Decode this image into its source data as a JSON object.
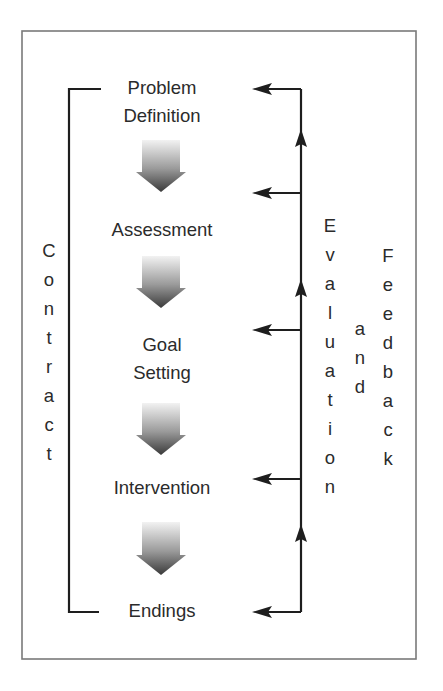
{
  "diagram": {
    "title": "",
    "colors": {
      "frame": "#7a7a7a",
      "lines": "#1e1e1e",
      "text": "#2b2b2b",
      "arrow_gradient_top": "#f2f2f2",
      "arrow_gradient_bottom": "#3a3a3a"
    },
    "steps": [
      {
        "lines": [
          "Problem",
          "Definition"
        ]
      },
      {
        "lines": [
          "Assessment"
        ]
      },
      {
        "lines": [
          "Goal",
          "Setting"
        ]
      },
      {
        "lines": [
          "Intervention"
        ]
      },
      {
        "lines": [
          "Endings"
        ]
      }
    ],
    "left_bracket_label": {
      "text": "Contract",
      "letters": [
        "C",
        "o",
        "n",
        "t",
        "r",
        "a",
        "c",
        "t"
      ]
    },
    "right_labels": {
      "evaluation": {
        "text": "Evaluation",
        "letters": [
          "E",
          "v",
          "a",
          "l",
          "u",
          "a",
          "t",
          "i",
          "o",
          "n"
        ]
      },
      "and": {
        "text": "and",
        "letters": [
          "a",
          "n",
          "d"
        ]
      },
      "feedback": {
        "text": "Feedback",
        "letters": [
          "F",
          "e",
          "e",
          "d",
          "b",
          "a",
          "c",
          "k"
        ]
      }
    },
    "flow_arrows": {
      "count": 4,
      "icon": "gradient-down-arrow"
    },
    "feedback_arrows": {
      "count": 5,
      "icon": "left-arrow",
      "up_arrow_count": 4
    }
  }
}
